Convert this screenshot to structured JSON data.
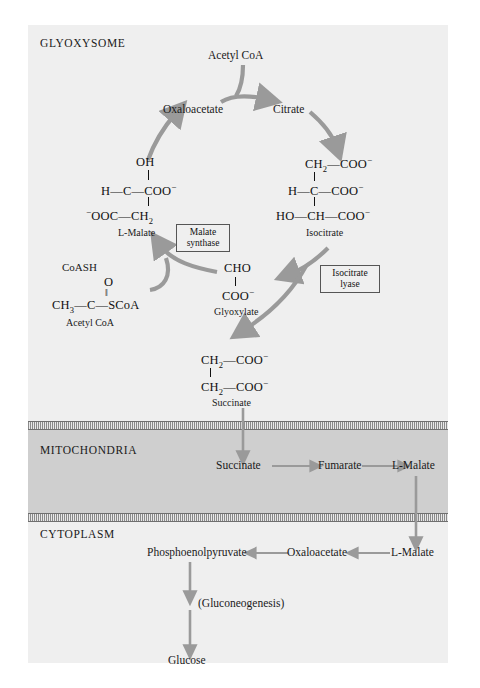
{
  "figure": {
    "type": "diagram",
    "colors": {
      "page_background": "#ffffff",
      "panel_background": "#efefef",
      "mitochondria_background": "#cfcfcf",
      "arrow_gray": "#9a9a9a",
      "thin_arrow_gray": "#9a9a9a",
      "text": "#1a1a1a",
      "membrane_line": "#6f6f6f"
    }
  },
  "compartments": {
    "glyoxysome": "GLYOXYSOME",
    "mitochondria": "MITOCHONDRIA",
    "cytoplasm": "CYTOPLASM"
  },
  "glyoxysome": {
    "acetyl_coa_top": "Acetyl CoA",
    "oxaloacetate": "Oxaloacetate",
    "citrate": "Citrate",
    "malate": {
      "row1": "OH",
      "row2_left": "H",
      "row2_center": "C",
      "row2_right": "COO",
      "row2_charge": "−",
      "row3_left_charge": "−",
      "row3_left": "OOC",
      "row3_right": "CH",
      "row3_sub": "2",
      "label": "L-Malate"
    },
    "isocitrate": {
      "row1_left": "CH",
      "row1_sub": "2",
      "row1_right": "COO",
      "row1_charge": "−",
      "row2_left": "H",
      "row2_center": "C",
      "row2_right": "COO",
      "row2_charge": "−",
      "row3_left": "HO",
      "row3_center": "CH",
      "row3_right": "COO",
      "row3_charge": "−",
      "label": "Isocitrate"
    },
    "acetyl_coa_structure": {
      "coash": "CoASH",
      "oxygen": "O",
      "double_bond": "‖",
      "chain_left": "CH",
      "chain_left_sub": "3",
      "chain_center": "C",
      "chain_right": "SCoA",
      "label": "Acetyl CoA"
    },
    "glyoxylate": {
      "row1": "CHO",
      "row2": "COO",
      "row2_charge": "−",
      "label": "Glyoxylate"
    },
    "succinate": {
      "row1_left": "CH",
      "row1_sub": "2",
      "row1_right": "COO",
      "row1_charge": "−",
      "row2_left": "CH",
      "row2_sub": "2",
      "row2_right": "COO",
      "row2_charge": "−",
      "label": "Succinate"
    },
    "enzymes": [
      {
        "name": "malate-synthase",
        "line1": "Malate",
        "line2": "synthase"
      },
      {
        "name": "isocitrate-lyase",
        "line1": "Isocitrate",
        "line2": "lyase"
      }
    ]
  },
  "mitochondria_pathway": {
    "succinate": "Succinate",
    "fumarate": "Fumarate",
    "malate": "L-Malate"
  },
  "cytoplasm_pathway": {
    "pep": "Phosphoenolpyruvate",
    "oxaloacetate": "Oxaloacetate",
    "malate": "L-Malate",
    "gluconeogenesis": "(Gluconeogenesis)",
    "glucose": "Glucose"
  }
}
